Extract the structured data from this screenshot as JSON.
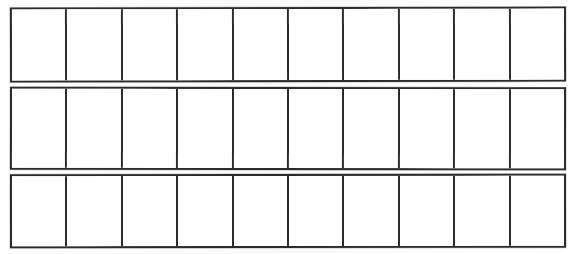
{
  "document": {
    "title": "Blank Ten-Cell Strips Worksheet",
    "kind": "printed-grid-worksheet",
    "background_color": "#ffffff",
    "line_color": "#2b2b2b",
    "cell_fill_color": "#ffffff",
    "canvas": {
      "width": 571,
      "height": 254
    }
  },
  "grid": {
    "row_count": 3,
    "columns_per_row": 10,
    "line_thickness_px": 2,
    "rows": [
      {
        "id": "strip-1",
        "label": "Strip 1",
        "left": 10,
        "top": 7,
        "width": 556,
        "height": 75,
        "cells": [
          {
            "index": 1,
            "content": ""
          },
          {
            "index": 2,
            "content": ""
          },
          {
            "index": 3,
            "content": ""
          },
          {
            "index": 4,
            "content": ""
          },
          {
            "index": 5,
            "content": ""
          },
          {
            "index": 6,
            "content": ""
          },
          {
            "index": 7,
            "content": ""
          },
          {
            "index": 8,
            "content": ""
          },
          {
            "index": 9,
            "content": ""
          },
          {
            "index": 10,
            "content": ""
          }
        ]
      },
      {
        "id": "strip-2",
        "label": "Strip 2",
        "left": 10,
        "top": 87,
        "width": 556,
        "height": 83,
        "cells": [
          {
            "index": 1,
            "content": ""
          },
          {
            "index": 2,
            "content": ""
          },
          {
            "index": 3,
            "content": ""
          },
          {
            "index": 4,
            "content": ""
          },
          {
            "index": 5,
            "content": ""
          },
          {
            "index": 6,
            "content": ""
          },
          {
            "index": 7,
            "content": ""
          },
          {
            "index": 8,
            "content": ""
          },
          {
            "index": 9,
            "content": ""
          },
          {
            "index": 10,
            "content": ""
          }
        ]
      },
      {
        "id": "strip-3",
        "label": "Strip 3",
        "left": 10,
        "top": 174,
        "width": 556,
        "height": 74,
        "cells": [
          {
            "index": 1,
            "content": ""
          },
          {
            "index": 2,
            "content": ""
          },
          {
            "index": 3,
            "content": ""
          },
          {
            "index": 4,
            "content": ""
          },
          {
            "index": 5,
            "content": ""
          },
          {
            "index": 6,
            "content": ""
          },
          {
            "index": 7,
            "content": ""
          },
          {
            "index": 8,
            "content": ""
          },
          {
            "index": 9,
            "content": ""
          },
          {
            "index": 10,
            "content": ""
          }
        ]
      }
    ]
  }
}
